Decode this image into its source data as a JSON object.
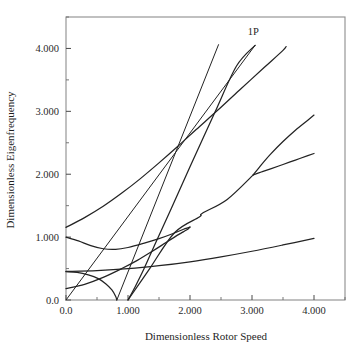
{
  "chart_data": {
    "type": "line",
    "title": "",
    "xlabel": "Dimensionless Rotor Speed",
    "ylabel": "Dimensionless Eigenfrequency",
    "xlim": [
      0.0,
      4.5
    ],
    "ylim": [
      0.0,
      4.5
    ],
    "grid": false,
    "legend": "none",
    "xticks": [
      0.0,
      1.0,
      2.0,
      3.0,
      4.0
    ],
    "xticklabels": [
      "0.0",
      "1.000",
      "2.000",
      "3.000",
      "4.000"
    ],
    "xminor": [
      0.5,
      1.5,
      2.5,
      3.5,
      4.5
    ],
    "yticks": [
      0.0,
      1.0,
      2.0,
      3.0,
      4.0
    ],
    "yticklabels": [
      "0.0",
      "1.000",
      "2.000",
      "3.000",
      "4.000"
    ],
    "yminor": [
      0.5,
      1.5,
      2.5,
      3.5,
      4.5
    ],
    "annotations": [
      {
        "text": "1P",
        "x": 3.02,
        "y": 4.22
      }
    ],
    "series": [
      {
        "name": "1P excitation line",
        "style": "solid",
        "points": [
          [
            0.0,
            0.0
          ],
          [
            3.05,
            4.05
          ]
        ]
      },
      {
        "name": "straight-line-upper",
        "style": "solid",
        "points": [
          [
            0.82,
            0.0
          ],
          [
            2.46,
            4.06
          ]
        ]
      },
      {
        "name": "backward-mode-branch-low",
        "style": "solid",
        "points": [
          [
            0.0,
            0.45
          ],
          [
            0.18,
            0.44
          ],
          [
            0.36,
            0.4
          ],
          [
            0.52,
            0.34
          ],
          [
            0.64,
            0.26
          ],
          [
            0.74,
            0.16
          ],
          [
            0.8,
            0.06
          ],
          [
            0.82,
            0.0
          ]
        ]
      },
      {
        "name": "forward-mode-branch-from-one",
        "style": "solid",
        "points": [
          [
            1.0,
            0.0
          ],
          [
            1.12,
            0.22
          ],
          [
            1.26,
            0.5
          ],
          [
            1.45,
            0.92
          ],
          [
            1.7,
            1.46
          ],
          [
            2.0,
            2.12
          ],
          [
            2.4,
            2.98
          ],
          [
            2.75,
            3.72
          ],
          [
            3.05,
            4.05
          ]
        ]
      },
      {
        "name": "lowest-forward-mode",
        "style": "solid",
        "points": [
          [
            0.0,
            0.455
          ],
          [
            0.5,
            0.468
          ],
          [
            1.0,
            0.497
          ],
          [
            1.5,
            0.545
          ],
          [
            2.0,
            0.608
          ],
          [
            2.5,
            0.686
          ],
          [
            3.0,
            0.775
          ],
          [
            3.5,
            0.875
          ],
          [
            4.0,
            0.98
          ]
        ]
      },
      {
        "name": "second-mode-veering-branch",
        "style": "solid",
        "points": [
          [
            0.0,
            1.0
          ],
          [
            0.2,
            0.94
          ],
          [
            0.4,
            0.865
          ],
          [
            0.6,
            0.815
          ],
          [
            0.8,
            0.805
          ],
          [
            1.0,
            0.835
          ],
          [
            1.25,
            0.9
          ],
          [
            1.5,
            0.975
          ],
          [
            1.75,
            1.065
          ],
          [
            1.92,
            1.135
          ],
          [
            2.0,
            1.16
          ]
        ]
      },
      {
        "name": "second-mode-veering-return",
        "style": "solid",
        "points": [
          [
            2.0,
            1.16
          ],
          [
            1.97,
            1.13
          ],
          [
            1.92,
            1.1
          ],
          [
            1.85,
            1.06
          ],
          [
            1.75,
            1.0
          ],
          [
            1.6,
            0.905
          ],
          [
            1.4,
            0.78
          ],
          [
            1.15,
            0.63
          ],
          [
            0.9,
            0.5
          ],
          [
            0.6,
            0.36
          ],
          [
            0.3,
            0.25
          ],
          [
            0.0,
            0.18
          ]
        ]
      },
      {
        "name": "third-mode-upper-branch",
        "style": "solid",
        "points": [
          [
            0.0,
            1.155
          ],
          [
            0.3,
            1.31
          ],
          [
            0.6,
            1.49
          ],
          [
            0.9,
            1.7
          ],
          [
            1.2,
            1.93
          ],
          [
            1.5,
            2.18
          ],
          [
            1.8,
            2.44
          ],
          [
            2.1,
            2.71
          ],
          [
            2.45,
            3.02
          ],
          [
            2.8,
            3.34
          ],
          [
            3.2,
            3.7
          ],
          [
            3.5,
            3.97
          ],
          [
            3.55,
            4.03
          ]
        ]
      },
      {
        "name": "fourth-mode-veer-upper",
        "style": "solid",
        "points": [
          [
            3.02,
            1.99
          ],
          [
            3.15,
            2.15
          ],
          [
            3.3,
            2.32
          ],
          [
            3.5,
            2.52
          ],
          [
            3.7,
            2.7
          ],
          [
            3.9,
            2.86
          ],
          [
            4.0,
            2.94
          ]
        ]
      },
      {
        "name": "fourth-mode-veer-lower",
        "style": "solid",
        "points": [
          [
            3.02,
            1.99
          ],
          [
            3.15,
            2.035
          ],
          [
            3.3,
            2.085
          ],
          [
            3.5,
            2.155
          ],
          [
            3.7,
            2.225
          ],
          [
            3.9,
            2.295
          ],
          [
            4.0,
            2.33
          ]
        ]
      },
      {
        "name": "fourth-mode-incoming",
        "style": "solid",
        "points": [
          [
            1.0,
            0.0
          ],
          [
            1.35,
            0.5
          ],
          [
            1.75,
            1.07
          ],
          [
            2.15,
            1.32
          ],
          [
            2.2,
            1.38
          ],
          [
            2.6,
            1.6
          ],
          [
            3.02,
            1.99
          ]
        ]
      }
    ]
  },
  "axes": {
    "x_title": "Dimensionless Rotor Speed",
    "y_title": "Dimensionless Eigenfrequency"
  }
}
